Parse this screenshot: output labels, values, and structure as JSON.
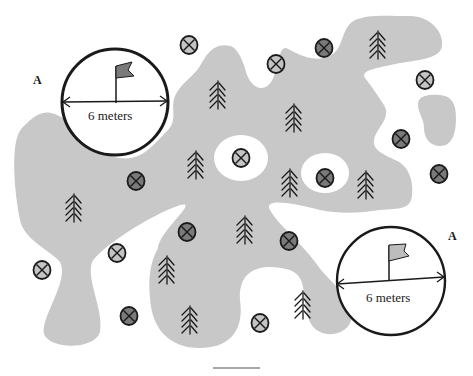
{
  "colors": {
    "terrain": "#c8c8c8",
    "background": "#ffffff",
    "ink": "#1a1a1a",
    "marker_light": "#c4c4c4",
    "marker_dark": "#7a7a7a",
    "flag": "#8a8a8a"
  },
  "zones": [
    {
      "letter": "A",
      "dimension": "6 meters",
      "flag_color": "dark"
    },
    {
      "letter": "A",
      "dimension": "6 meters",
      "flag_color": "light"
    }
  ],
  "markers": {
    "light": [
      [
        189,
        45
      ],
      [
        276,
        64
      ],
      [
        425,
        80
      ],
      [
        241,
        158
      ],
      [
        42,
        270
      ],
      [
        117,
        253
      ],
      [
        260,
        323
      ]
    ],
    "dark": [
      [
        324,
        48
      ],
      [
        401,
        139
      ],
      [
        136,
        181
      ],
      [
        325,
        178
      ],
      [
        439,
        174
      ],
      [
        187,
        232
      ],
      [
        289,
        241
      ],
      [
        129,
        316
      ]
    ]
  },
  "trees": [
    [
      218,
      95
    ],
    [
      294,
      118
    ],
    [
      378,
      45
    ],
    [
      196,
      165
    ],
    [
      74,
      208
    ],
    [
      290,
      183
    ],
    [
      366,
      185
    ],
    [
      245,
      230
    ],
    [
      167,
      270
    ],
    [
      190,
      320
    ],
    [
      303,
      305
    ]
  ],
  "icons": {
    "marker": "circled-x-marker-icon",
    "tree": "pine-tree-icon",
    "flag": "flag-icon"
  }
}
